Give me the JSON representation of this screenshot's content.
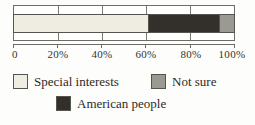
{
  "chart_data": {
    "type": "bar",
    "orientation": "horizontal",
    "stacked": true,
    "title": "",
    "subtitle": "",
    "xlabel": "",
    "ylabel": "",
    "categories": [
      ""
    ],
    "series": [
      {
        "name": "Special interests",
        "values": [
          61
        ],
        "color": "#efece1"
      },
      {
        "name": "American people",
        "values": [
          32
        ],
        "color": "#332f2b"
      },
      {
        "name": "Not sure",
        "values": [
          7
        ],
        "color": "#9a9a93"
      }
    ],
    "xlim": [
      0,
      100
    ],
    "xticks": [
      0,
      20,
      40,
      60,
      80,
      100
    ],
    "xtick_labels": [
      "0",
      "20%",
      "40%",
      "60%",
      "80%",
      "100%"
    ],
    "grid": true,
    "grid_axis": "x",
    "legend_position": "bottom",
    "units": "percent"
  },
  "axis": {
    "ticks": [
      {
        "label": "0",
        "value": 0
      },
      {
        "label": "20%",
        "value": 20
      },
      {
        "label": "40%",
        "value": 40
      },
      {
        "label": "60%",
        "value": 60
      },
      {
        "label": "80%",
        "value": 80
      },
      {
        "label": "100%",
        "value": 100
      }
    ]
  },
  "legend": {
    "row1": [
      {
        "label": "Special interests",
        "color": "#efece1"
      },
      {
        "label": "Not sure",
        "color": "#9a9a93"
      }
    ],
    "row2": [
      {
        "label": "American people",
        "color": "#332f2b"
      }
    ]
  },
  "colors": {
    "special_interests": "#efece1",
    "american_people": "#332f2b",
    "not_sure": "#9a9a93",
    "frame": "#6d6d68",
    "background": "#fdfdfb",
    "text": "#2b2b28"
  }
}
